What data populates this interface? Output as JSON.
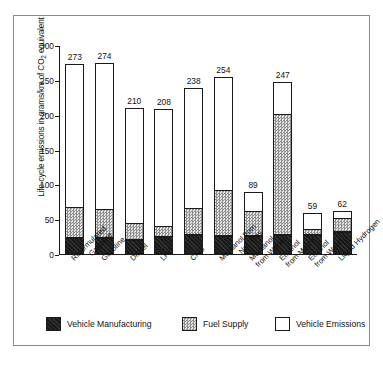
{
  "chart_data": {
    "type": "bar",
    "subtype": "stacked-bar",
    "title": "",
    "xlabel": "",
    "ylabel": "Life-cycle emissions in grams/km of CO2 equivalent",
    "ylabel_parts": {
      "before": "Life-cycle emissions in grams/km of CO",
      "sub": "2",
      "after": " equivalent"
    },
    "ylim": [
      0,
      300
    ],
    "yticks": [
      0,
      50,
      100,
      150,
      200,
      250,
      300
    ],
    "grid": false,
    "legend_position": "bottom",
    "categories": [
      "Reformulated Gasoline",
      "Gasoline",
      "Diesel",
      "LPG",
      "CNG",
      "Methanol from Nat. Gas",
      "Methanol from Wood",
      "Ethanol from Maize",
      "Ethanol from Wood",
      "Liquid Hydrogen"
    ],
    "category_lines": [
      [
        "Reformulated",
        "Gasoline"
      ],
      [
        "Gasoline",
        ""
      ],
      [
        "Diesel",
        ""
      ],
      [
        "LPG",
        ""
      ],
      [
        "CNG",
        ""
      ],
      [
        "Methanol from",
        "Nat. Gas"
      ],
      [
        "Methanol",
        "from Wood"
      ],
      [
        "Ethanol",
        "from Maize"
      ],
      [
        "Ethanol",
        "from Wood"
      ],
      [
        "Liquid Hydrogen",
        ""
      ]
    ],
    "series": [
      {
        "name": "Vehicle Manufacturing",
        "values": [
          23,
          23,
          20,
          24,
          27,
          26,
          26,
          27,
          27,
          32
        ]
      },
      {
        "name": "Fuel Supply",
        "values": [
          44,
          42,
          25,
          16,
          39,
          66,
          36,
          174,
          9,
          20
        ]
      },
      {
        "name": "Vehicle Emissions",
        "values": [
          206,
          209,
          165,
          168,
          172,
          162,
          27,
          46,
          23,
          10
        ]
      }
    ],
    "totals": [
      273,
      274,
      210,
      208,
      238,
      254,
      89,
      247,
      59,
      62
    ],
    "totals_labels": [
      "273",
      "274",
      "210",
      "208",
      "238",
      "254",
      "89",
      "247",
      "59",
      "62"
    ],
    "segment_tops": [
      [
        23,
        67,
        273
      ],
      [
        23,
        65,
        274
      ],
      [
        20,
        45,
        210
      ],
      [
        24,
        40,
        208
      ],
      [
        27,
        66,
        238
      ],
      [
        26,
        92,
        254
      ],
      [
        26,
        62,
        89
      ],
      [
        27,
        201,
        247
      ],
      [
        27,
        36,
        59
      ],
      [
        32,
        52,
        62
      ]
    ]
  },
  "legend": {
    "items": [
      {
        "label": "Vehicle Manufacturing",
        "swatch": "manufacturing",
        "color": "#1a1a1a"
      },
      {
        "label": "Fuel Supply",
        "swatch": "fuel",
        "color": "#c9c9c9"
      },
      {
        "label": "Vehicle Emissions",
        "swatch": "emissions",
        "color": "#ffffff"
      }
    ]
  },
  "axis": {
    "tick_labels": [
      "300",
      "250",
      "200",
      "150",
      "100",
      "50",
      "0"
    ]
  }
}
